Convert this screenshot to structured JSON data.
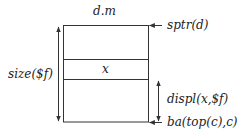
{
  "diagram": {
    "type": "stack-frame-layout",
    "labels": {
      "top": "d.m",
      "cell": "x",
      "size": "size($f)",
      "sptr": "sptr(d)",
      "displ": "displ(x,$f)",
      "base": "ba(top(c),c)"
    },
    "colors": {
      "line": "#333333",
      "text": "#222222",
      "background": "#ffffff"
    }
  }
}
